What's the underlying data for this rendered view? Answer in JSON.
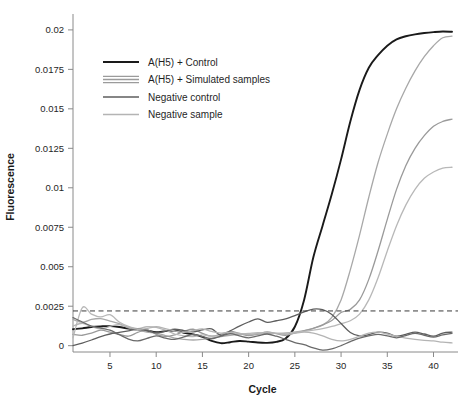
{
  "chart_data": {
    "type": "line",
    "title": "",
    "xlabel": "Cycle",
    "ylabel": "Fluorescence",
    "xlim": [
      1,
      42
    ],
    "ylim": [
      -0.0004,
      0.0205
    ],
    "xticks": [
      5,
      10,
      15,
      20,
      25,
      30,
      35,
      40
    ],
    "xtick_labels": [
      "5",
      "10",
      "15",
      "20",
      "25",
      "30",
      "35",
      "40"
    ],
    "yticks": [
      0,
      0.0025,
      0.005,
      0.0075,
      0.01,
      0.0125,
      0.015,
      0.0175,
      0.02
    ],
    "ytick_labels": [
      "0",
      "0.0025",
      "0.005",
      "0.0075",
      "0.01",
      "0.0125",
      "0.015",
      "0.0175",
      "0.02"
    ],
    "grid": false,
    "legend_position": "upper-left",
    "threshold": {
      "label": "Detection threshold",
      "value": 0.0022,
      "style": "dashed",
      "color": "#3a3a3a"
    },
    "legend": [
      {
        "label": "A(H5) + Control",
        "color": "#1a1a1a",
        "width": 1.9,
        "lines": 1
      },
      {
        "label": "A(H5) + Simulated samples",
        "color": "#9b9b9b",
        "width": 1.3,
        "lines": 3
      },
      {
        "label": "Negative control",
        "color": "#5e5e5e",
        "width": 1.3,
        "lines": 1
      },
      {
        "label": "Negative sample",
        "color": "#b4b4b4",
        "width": 1.3,
        "lines": 1
      }
    ],
    "x": [
      1,
      2,
      3,
      4,
      5,
      6,
      7,
      8,
      9,
      10,
      11,
      12,
      13,
      14,
      15,
      16,
      17,
      18,
      19,
      20,
      21,
      22,
      23,
      24,
      25,
      26,
      27,
      28,
      29,
      30,
      31,
      32,
      33,
      34,
      35,
      36,
      37,
      38,
      39,
      40,
      41,
      42
    ],
    "series": [
      {
        "name": "A(H5) + Control",
        "group": "positive-control",
        "color": "#1a1a1a",
        "width": 1.9,
        "values": [
          0.00104,
          0.0011,
          0.00118,
          0.00122,
          0.00124,
          0.00118,
          0.00108,
          0.00104,
          0.00096,
          0.00086,
          0.00092,
          0.00096,
          0.00082,
          0.00072,
          0.00056,
          0.0003,
          0.00016,
          0.00022,
          0.0003,
          0.00026,
          0.0002,
          0.00018,
          0.00024,
          0.00046,
          0.0012,
          0.0029,
          0.0056,
          0.0076,
          0.0096,
          0.0118,
          0.0142,
          0.0162,
          0.0176,
          0.0184,
          0.019,
          0.0194,
          0.0196,
          0.01972,
          0.0198,
          0.01986,
          0.0199,
          0.01988
        ]
      },
      {
        "name": "A(H5) + Simulated sample 1",
        "group": "simulated",
        "color": "#a8a8a8",
        "width": 1.3,
        "values": [
          0.00166,
          0.00148,
          0.00166,
          0.00172,
          0.00156,
          0.0014,
          0.00112,
          0.001,
          0.00086,
          0.0008,
          0.00064,
          0.00048,
          0.0004,
          0.00036,
          0.0004,
          0.00048,
          0.00058,
          0.00066,
          0.0007,
          0.00072,
          0.00074,
          0.00076,
          0.00078,
          0.0008,
          0.00086,
          0.00096,
          0.0011,
          0.0013,
          0.0018,
          0.0029,
          0.0048,
          0.007,
          0.0094,
          0.0116,
          0.0134,
          0.015,
          0.0163,
          0.0174,
          0.0183,
          0.019,
          0.0195,
          0.0196
        ]
      },
      {
        "name": "A(H5) + Simulated sample 2",
        "group": "simulated",
        "color": "#9a9a9a",
        "width": 1.3,
        "values": [
          0.00072,
          0.00066,
          0.0008,
          0.00098,
          0.00086,
          0.00072,
          0.0006,
          0.00084,
          0.001,
          0.00072,
          0.00058,
          0.00068,
          0.0009,
          0.00104,
          0.00078,
          0.0006,
          0.00072,
          0.0009,
          0.00078,
          0.00064,
          0.00074,
          0.00088,
          0.00076,
          0.00066,
          0.0008,
          0.00094,
          0.0011,
          0.00132,
          0.0016,
          0.0021,
          0.0023,
          0.0029,
          0.0042,
          0.006,
          0.008,
          0.0099,
          0.0114,
          0.0125,
          0.0133,
          0.0139,
          0.0142,
          0.01435
        ]
      },
      {
        "name": "A(H5) + Simulated sample 3",
        "group": "simulated",
        "color": "#b8b8b8",
        "width": 1.3,
        "values": [
          0.0005,
          0.0024,
          0.002,
          0.00182,
          0.00196,
          0.0015,
          0.00122,
          0.00108,
          0.0012,
          0.00116,
          0.00098,
          0.00074,
          0.00062,
          0.00058,
          0.00068,
          0.0006,
          0.00066,
          0.00076,
          0.00074,
          0.00078,
          0.00082,
          0.0008,
          0.00078,
          0.0008,
          0.00084,
          0.0009,
          0.00098,
          0.00108,
          0.00122,
          0.0014,
          0.00158,
          0.002,
          0.0029,
          0.0043,
          0.006,
          0.0076,
          0.0089,
          0.0099,
          0.0106,
          0.011,
          0.01125,
          0.0113
        ]
      },
      {
        "name": "Negative control",
        "group": "negative-control",
        "color": "#5e5e5e",
        "width": 1.3,
        "values": [
          0.0,
          0.00016,
          0.00036,
          0.00058,
          0.00074,
          0.00084,
          0.00094,
          0.00104,
          0.00096,
          0.00082,
          0.00092,
          0.00104,
          0.00096,
          0.00088,
          0.001,
          0.00106,
          0.00066,
          0.00094,
          0.00124,
          0.0015,
          0.0017,
          0.00148,
          0.00158,
          0.0017,
          0.0019,
          0.00214,
          0.00232,
          0.00228,
          0.00198,
          0.0014,
          0.00084,
          0.00062,
          0.0007,
          0.00086,
          0.0008,
          0.0006,
          0.00072,
          0.00086,
          0.00074,
          0.0006,
          0.0008,
          0.00086
        ]
      },
      {
        "name": "Negative sample",
        "group": "negative-sample",
        "color": "#b4b4b4",
        "width": 1.3,
        "values": [
          0.00124,
          0.00142,
          0.00122,
          0.00106,
          0.00122,
          0.00134,
          0.00118,
          0.00104,
          0.00108,
          0.0012,
          0.00108,
          0.00094,
          0.00084,
          0.00096,
          0.00106,
          0.0009,
          0.0008,
          0.00084,
          0.00078,
          0.0007,
          0.00076,
          0.00082,
          0.00078,
          0.00072,
          0.0008,
          0.00086,
          0.0008,
          0.00062,
          0.0004,
          0.0003,
          0.0004,
          0.0006,
          0.0008,
          0.00086,
          0.00074,
          0.0006,
          0.00048,
          0.0004,
          0.00034,
          0.0003,
          0.00022,
          0.00018
        ]
      },
      {
        "name": "Negative control 2",
        "group": "negative-control",
        "color": "#6a6a6a",
        "width": 1.3,
        "values": [
          0.00178,
          0.0015,
          0.00124,
          0.00112,
          0.00098,
          0.0007,
          0.00042,
          0.0003,
          0.00046,
          0.00062,
          0.00048,
          0.0004,
          0.00056,
          0.00072,
          0.00058,
          0.00044,
          0.0006,
          0.00076,
          0.00062,
          0.0005,
          0.00062,
          0.00074,
          0.0006,
          0.0004,
          0.0002,
          6e-05,
          -0.00014,
          -0.00028,
          -0.0002,
          0.0,
          0.00026,
          0.00048,
          0.00062,
          0.00072,
          0.00062,
          0.0005,
          0.00064,
          0.00078,
          0.00066,
          0.00054,
          0.00068,
          0.00078
        ]
      }
    ]
  }
}
